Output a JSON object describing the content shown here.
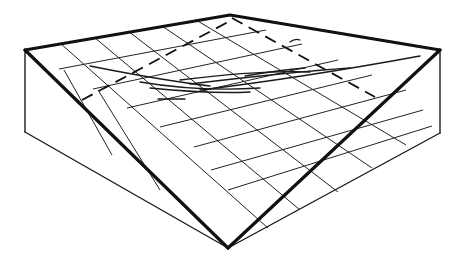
{
  "diagram": {
    "kind": "3d-wireframe-box-with-tilted-grid-plane",
    "colors": {
      "line": "#111111",
      "background": "#ffffff"
    },
    "vertices": {
      "top": [
        230,
        15
      ],
      "left_top": [
        25,
        50
      ],
      "right_top": [
        440,
        50
      ],
      "bottom": [
        228,
        248
      ],
      "left_bottom": [
        25,
        132
      ],
      "right_bottom": [
        440,
        133
      ]
    },
    "grid": {
      "divisions": 6
    },
    "labels": []
  }
}
